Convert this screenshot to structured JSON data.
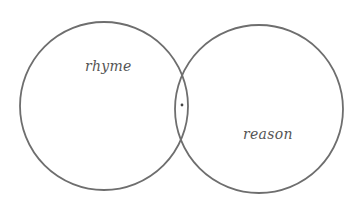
{
  "diagram": {
    "type": "venn",
    "sets": [
      {
        "id": "left",
        "label": "rhyme",
        "cx": 104,
        "cy": 106,
        "r": 84
      },
      {
        "id": "right",
        "label": "reason",
        "cx": 259,
        "cy": 109,
        "r": 84
      }
    ],
    "intersection_marker": {
      "x": 182,
      "y": 105,
      "r": 1.4
    },
    "colors": {
      "stroke": "#6e6e6e",
      "text": "#555555",
      "background": "#ffffff"
    }
  }
}
